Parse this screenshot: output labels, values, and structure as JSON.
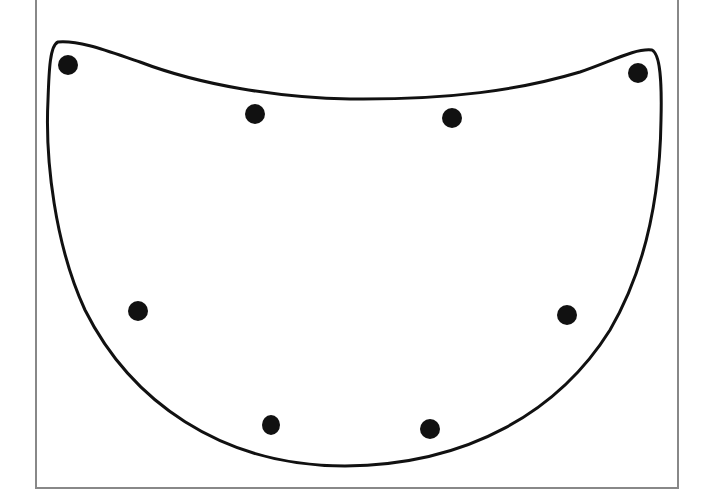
{
  "diagram": {
    "colors": {
      "frame": "#888888",
      "outline": "#111111",
      "dot": "#111111",
      "background": "#ffffff"
    },
    "shape": {
      "type": "closed-curve",
      "top_left_corner": [
        56,
        42
      ],
      "top_right_corner": [
        655,
        49
      ],
      "bottom": [
        345,
        465
      ]
    },
    "dots": [
      {
        "id": "dot-1",
        "x": 68,
        "y": 65
      },
      {
        "id": "dot-2",
        "x": 255,
        "y": 114
      },
      {
        "id": "dot-3",
        "x": 452,
        "y": 118
      },
      {
        "id": "dot-4",
        "x": 638,
        "y": 73
      },
      {
        "id": "dot-5",
        "x": 138,
        "y": 311
      },
      {
        "id": "dot-6",
        "x": 567,
        "y": 315
      },
      {
        "id": "dot-7",
        "x": 271,
        "y": 425
      },
      {
        "id": "dot-8",
        "x": 430,
        "y": 429
      }
    ]
  }
}
